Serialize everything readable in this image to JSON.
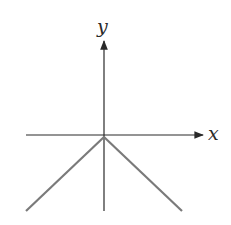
{
  "figure": {
    "x_axis_label": "x",
    "y_axis_label": "y",
    "axis_color": "#2a2a2a",
    "graph_color": "#7a7a7a",
    "function": "y = -|x|"
  }
}
